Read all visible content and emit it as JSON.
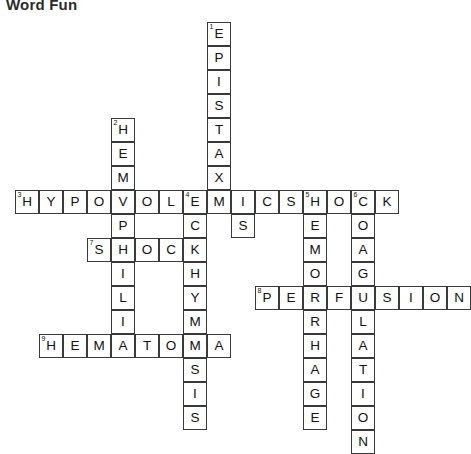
{
  "page": {
    "title": "Word Fun",
    "type": "crossword-puzzle",
    "grid": {
      "cell_size": 24,
      "origin_x": 15,
      "origin_y": 22,
      "cols": 18,
      "rows": 17
    }
  },
  "entries": [
    {
      "number": 1,
      "answer": "EPISTAXIS",
      "direction": "down",
      "col": 8,
      "row": 0
    },
    {
      "number": 2,
      "answer": "HEMOPHILIA",
      "direction": "down",
      "col": 4,
      "row": 4
    },
    {
      "number": 3,
      "answer": "HYPOVOLEMICSHOCK",
      "direction": "across",
      "col": 0,
      "row": 7
    },
    {
      "number": 4,
      "answer": "ECCHYMOSIS",
      "direction": "down",
      "col": 7,
      "row": 7
    },
    {
      "number": 5,
      "answer": "HEMORRHAGE",
      "direction": "down",
      "col": 12,
      "row": 7
    },
    {
      "number": 6,
      "answer": "COAGULATION",
      "direction": "down",
      "col": 14,
      "row": 7
    },
    {
      "number": 7,
      "answer": "SHOCK",
      "direction": "across",
      "col": 3,
      "row": 10
    },
    {
      "number": 8,
      "answer": "PERFUSION",
      "direction": "across",
      "col": 10,
      "row": 11
    },
    {
      "number": 9,
      "answer": "HEMATOMA",
      "direction": "across",
      "col": 1,
      "row": 14
    }
  ],
  "cells": [
    {
      "col": 8,
      "row": 0,
      "letter": "E",
      "num": 1
    },
    {
      "col": 8,
      "row": 1,
      "letter": "P"
    },
    {
      "col": 8,
      "row": 2,
      "letter": "I"
    },
    {
      "col": 8,
      "row": 3,
      "letter": "S"
    },
    {
      "col": 8,
      "row": 4,
      "letter": "T"
    },
    {
      "col": 8,
      "row": 5,
      "letter": "A"
    },
    {
      "col": 8,
      "row": 6,
      "letter": "X"
    },
    {
      "col": 4,
      "row": 4,
      "letter": "H",
      "num": 2
    },
    {
      "col": 4,
      "row": 5,
      "letter": "E"
    },
    {
      "col": 4,
      "row": 6,
      "letter": "M"
    },
    {
      "col": 0,
      "row": 7,
      "letter": "H",
      "num": 3
    },
    {
      "col": 1,
      "row": 7,
      "letter": "Y"
    },
    {
      "col": 2,
      "row": 7,
      "letter": "P"
    },
    {
      "col": 3,
      "row": 7,
      "letter": "O"
    },
    {
      "col": 4,
      "row": 7,
      "letter": "V"
    },
    {
      "col": 5,
      "row": 7,
      "letter": "O"
    },
    {
      "col": 6,
      "row": 7,
      "letter": "L"
    },
    {
      "col": 7,
      "row": 7,
      "letter": "E",
      "num": 4
    },
    {
      "col": 8,
      "row": 7,
      "letter": "M"
    },
    {
      "col": 9,
      "row": 7,
      "letter": "I"
    },
    {
      "col": 10,
      "row": 7,
      "letter": "C"
    },
    {
      "col": 11,
      "row": 7,
      "letter": "S"
    },
    {
      "col": 12,
      "row": 7,
      "letter": "H",
      "num": 5
    },
    {
      "col": 13,
      "row": 7,
      "letter": "O"
    },
    {
      "col": 14,
      "row": 7,
      "letter": "C",
      "num": 6
    },
    {
      "col": 15,
      "row": 7,
      "letter": "K"
    },
    {
      "col": 4,
      "row": 8,
      "letter": "P"
    },
    {
      "col": 7,
      "row": 8,
      "letter": "C"
    },
    {
      "col": 9,
      "row": 8,
      "letter": "S"
    },
    {
      "col": 12,
      "row": 8,
      "letter": "E"
    },
    {
      "col": 14,
      "row": 8,
      "letter": "O"
    },
    {
      "col": 3,
      "row": 9,
      "letter": "S",
      "num": 7
    },
    {
      "col": 4,
      "row": 9,
      "letter": "H"
    },
    {
      "col": 5,
      "row": 9,
      "letter": "O"
    },
    {
      "col": 6,
      "row": 9,
      "letter": "C"
    },
    {
      "col": 7,
      "row": 9,
      "letter": "K"
    },
    {
      "col": 12,
      "row": 9,
      "letter": "M"
    },
    {
      "col": 14,
      "row": 9,
      "letter": "A"
    },
    {
      "col": 4,
      "row": 10,
      "letter": "I"
    },
    {
      "col": 7,
      "row": 10,
      "letter": "H"
    },
    {
      "col": 12,
      "row": 10,
      "letter": "O"
    },
    {
      "col": 14,
      "row": 10,
      "letter": "G"
    },
    {
      "col": 4,
      "row": 11,
      "letter": "L"
    },
    {
      "col": 7,
      "row": 11,
      "letter": "Y"
    },
    {
      "col": 10,
      "row": 11,
      "letter": "P",
      "num": 8
    },
    {
      "col": 11,
      "row": 11,
      "letter": "E"
    },
    {
      "col": 12,
      "row": 11,
      "letter": "R"
    },
    {
      "col": 13,
      "row": 11,
      "letter": "F"
    },
    {
      "col": 14,
      "row": 11,
      "letter": "U"
    },
    {
      "col": 15,
      "row": 11,
      "letter": "S"
    },
    {
      "col": 16,
      "row": 11,
      "letter": "I"
    },
    {
      "col": 17,
      "row": 11,
      "letter": "O"
    },
    {
      "col": 18,
      "row": 11,
      "letter": "N"
    },
    {
      "col": 4,
      "row": 12,
      "letter": "I"
    },
    {
      "col": 7,
      "row": 12,
      "letter": "M"
    },
    {
      "col": 12,
      "row": 12,
      "letter": "R"
    },
    {
      "col": 14,
      "row": 12,
      "letter": "L"
    },
    {
      "col": 1,
      "row": 13,
      "letter": "H",
      "num": 9
    },
    {
      "col": 2,
      "row": 13,
      "letter": "E"
    },
    {
      "col": 3,
      "row": 13,
      "letter": "M"
    },
    {
      "col": 4,
      "row": 13,
      "letter": "A"
    },
    {
      "col": 5,
      "row": 13,
      "letter": "T"
    },
    {
      "col": 6,
      "row": 13,
      "letter": "O"
    },
    {
      "col": 7,
      "row": 13,
      "letter": "M"
    },
    {
      "col": 8,
      "row": 13,
      "letter": "A"
    },
    {
      "col": 12,
      "row": 13,
      "letter": "H"
    },
    {
      "col": 14,
      "row": 13,
      "letter": "A"
    },
    {
      "col": 7,
      "row": 14,
      "letter": "S"
    },
    {
      "col": 12,
      "row": 14,
      "letter": "A"
    },
    {
      "col": 14,
      "row": 14,
      "letter": "T"
    },
    {
      "col": 7,
      "row": 15,
      "letter": "I"
    },
    {
      "col": 12,
      "row": 15,
      "letter": "G"
    },
    {
      "col": 14,
      "row": 15,
      "letter": "I"
    },
    {
      "col": 7,
      "row": 16,
      "letter": "S"
    },
    {
      "col": 12,
      "row": 16,
      "letter": "E"
    },
    {
      "col": 14,
      "row": 16,
      "letter": "O"
    },
    {
      "col": 14,
      "row": 17,
      "letter": "N"
    }
  ]
}
